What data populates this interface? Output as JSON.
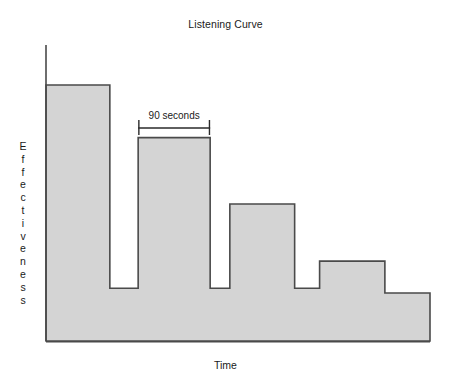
{
  "chart_data": {
    "type": "area",
    "title": "Listening Curve",
    "xlabel": "Time",
    "ylabel": "Effectiveness",
    "grid": false,
    "legend": false,
    "axis_style": "arrowless-L-axis, no tick marks, no numeric tick labels",
    "xlim": [
      0,
      8
    ],
    "ylim": [
      0,
      10
    ],
    "categories": [
      "burst 1",
      "dip 1",
      "burst 2",
      "dip 2",
      "burst 3",
      "dip 3",
      "burst 4",
      "tail"
    ],
    "values": [
      8.65,
      1.78,
      6.87,
      1.78,
      4.63,
      1.78,
      2.7,
      1.62
    ],
    "segment_widths": [
      64,
      28,
      72,
      20,
      65,
      25,
      65,
      45
    ],
    "steps": [
      {
        "label": "burst 1",
        "x_start": 0.0,
        "x_end": 1.33,
        "value": 8.65
      },
      {
        "label": "dip 1",
        "x_start": 1.33,
        "x_end": 1.92,
        "value": 1.78
      },
      {
        "label": "burst 2",
        "x_start": 1.92,
        "x_end": 3.42,
        "value": 6.87
      },
      {
        "label": "dip 2",
        "x_start": 3.42,
        "x_end": 3.83,
        "value": 1.78
      },
      {
        "label": "burst 3",
        "x_start": 3.83,
        "x_end": 5.18,
        "value": 4.63
      },
      {
        "label": "dip 3",
        "x_start": 5.18,
        "x_end": 5.7,
        "value": 1.78
      },
      {
        "label": "burst 4",
        "x_start": 5.7,
        "x_end": 7.06,
        "value": 2.7
      },
      {
        "label": "tail",
        "x_start": 7.06,
        "x_end": 8.0,
        "value": 1.62
      }
    ],
    "annotations": [
      {
        "text": "90 seconds",
        "type": "span-bracket",
        "x_start": 1.92,
        "x_end": 3.42,
        "describes": "width of burst 2 plateau"
      }
    ],
    "colors": {
      "fill": "#d4d4d4",
      "stroke": "#4a4a4a",
      "axis": "#4a4a4a",
      "text": "#1a1a1a",
      "background": "#ffffff"
    }
  },
  "labels": {
    "ylabel_letters": [
      "E",
      "f",
      "f",
      "e",
      "c",
      "t",
      "i",
      "v",
      "e",
      "n",
      "e",
      "s",
      "s"
    ]
  }
}
